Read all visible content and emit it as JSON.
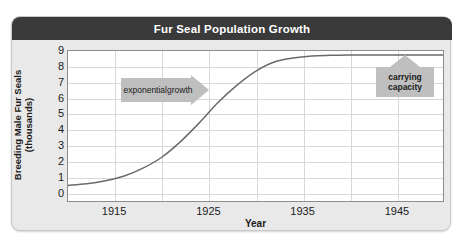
{
  "figure": {
    "title": "Fur Seal Population Growth",
    "background_color": "#e9e9e9",
    "title_bar_color": "#3a3a3a",
    "title_text_color": "#ffffff"
  },
  "chart_data": {
    "type": "line",
    "title": "Fur Seal Population Growth",
    "xlabel": "Year",
    "ylabel": "Breeding Male Fur Seals (thousands)",
    "ylabel_line1": "Breeding Male Fur Seals",
    "ylabel_line2": "(thousands)",
    "xlim": [
      1910,
      1950
    ],
    "ylim": [
      0,
      9.6
    ],
    "xticks": [
      1915,
      1925,
      1935,
      1945
    ],
    "yticks": [
      0,
      1,
      2,
      3,
      4,
      5,
      6,
      7,
      8,
      9
    ],
    "grid": true,
    "grid_x_step": 5,
    "grid_y_step": 1,
    "legend": "none",
    "series": [
      {
        "name": "Breeding male fur seals",
        "color": "#6a6a6a",
        "x": [
          1910,
          1912,
          1914,
          1916,
          1918,
          1920,
          1922,
          1924,
          1926,
          1928,
          1930,
          1932,
          1934,
          1936,
          1938,
          1940,
          1942,
          1944,
          1946,
          1948,
          1950
        ],
        "y": [
          1.0,
          1.1,
          1.3,
          1.6,
          2.1,
          2.8,
          3.8,
          5.0,
          6.3,
          7.4,
          8.3,
          8.9,
          9.15,
          9.28,
          9.32,
          9.34,
          9.35,
          9.35,
          9.35,
          9.35,
          9.35
        ]
      }
    ],
    "annotations": [
      {
        "id": "exponential-growth",
        "text": "exponential growth",
        "line1": "exponential",
        "line2": "growth",
        "shape": "right-arrow-banner",
        "color": "#bfbfbf",
        "points_to": "steep rising portion of curve"
      },
      {
        "id": "carrying-capacity",
        "text": "carrying capacity",
        "line1": "carrying",
        "line2": "capacity",
        "shape": "box-with-up-arrow",
        "color": "#bfbfbf",
        "points_to": "plateau of curve near 9.35 thousand"
      }
    ]
  }
}
